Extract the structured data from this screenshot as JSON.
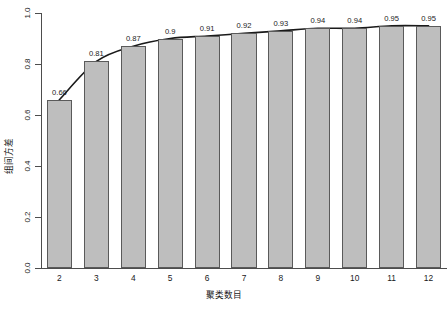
{
  "chart_data": {
    "type": "bar",
    "title": "",
    "subtitle": "",
    "xlabel": "聚类数目",
    "ylabel": "组间方差",
    "categories": [
      "2",
      "3",
      "4",
      "5",
      "6",
      "7",
      "8",
      "9",
      "10",
      "11",
      "12"
    ],
    "values": [
      0.66,
      0.81,
      0.87,
      0.9,
      0.91,
      0.92,
      0.93,
      0.94,
      0.94,
      0.95,
      0.95
    ],
    "point_labels": [
      "0.66",
      "0.81",
      "0.87",
      "0.9",
      "0.91",
      "0.92",
      "0.93",
      "0.94",
      "0.94",
      "0.95",
      "0.95"
    ],
    "series": [
      {
        "name": "组间方差",
        "kind": "bar",
        "values": [
          0.66,
          0.81,
          0.87,
          0.9,
          0.91,
          0.92,
          0.93,
          0.94,
          0.94,
          0.95,
          0.95
        ]
      },
      {
        "name": "趋势线",
        "kind": "line",
        "values": [
          0.66,
          0.81,
          0.87,
          0.9,
          0.91,
          0.92,
          0.93,
          0.94,
          0.94,
          0.95,
          0.95
        ]
      }
    ],
    "ylim": [
      0.0,
      1.0
    ],
    "xlim": [
      1.5,
      12.5
    ],
    "ytick_labels": [
      "0.0",
      "0.2",
      "0.4",
      "0.6",
      "0.8",
      "1.0"
    ],
    "ytick_values": [
      0.0,
      0.2,
      0.4,
      0.6,
      0.8,
      1.0
    ],
    "xtick_labels": [
      "2",
      "3",
      "4",
      "5",
      "6",
      "7",
      "8",
      "9",
      "10",
      "11",
      "12"
    ],
    "grid": false,
    "legend": false,
    "legend_position": "none",
    "bar_color": "#bebebe",
    "bar_border_color": "#5a5a5a",
    "line_color": "#1a1a1a",
    "axis_color": "#4d4d4d",
    "background_color": "#ffffff",
    "text_color": "#1a1a1a"
  }
}
